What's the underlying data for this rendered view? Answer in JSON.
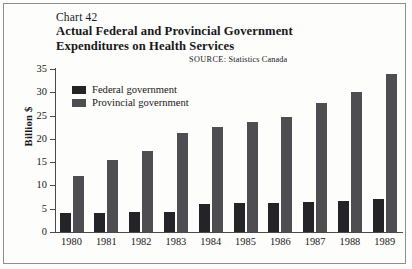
{
  "header": {
    "chart_number": "Chart 42",
    "title_line1": "Actual Federal and Provincial Government",
    "title_line2": "Expenditures on Health Services",
    "source_label": "SOURCE:",
    "source_value": "Statistics Canada"
  },
  "legend": {
    "items": [
      {
        "label": "Federal government",
        "color": "#242428",
        "key": "federal"
      },
      {
        "label": "Provincial government",
        "color": "#4e4e52",
        "key": "provincial"
      }
    ]
  },
  "axes": {
    "ylabel": "Billion $",
    "yticks": [
      "35",
      "30",
      "25",
      "20",
      "15",
      "10",
      "5",
      "0"
    ],
    "ymin": 0,
    "ymax": 35
  },
  "chart_data": {
    "type": "bar",
    "title": "Actual Federal and Provincial Government Expenditures on Health Services",
    "subtitle": "Chart 42",
    "xlabel": "",
    "ylabel": "Billion $",
    "ylim": [
      0,
      35
    ],
    "ytick_step": 5,
    "grid": false,
    "legend_position": "top-left inside plot",
    "categories": [
      "1980",
      "1981",
      "1982",
      "1983",
      "1984",
      "1985",
      "1986",
      "1987",
      "1988",
      "1989"
    ],
    "series": [
      {
        "name": "Federal government",
        "color": "#242428",
        "values": [
          4.0,
          4.0,
          4.3,
          4.2,
          6.0,
          6.2,
          6.2,
          6.5,
          6.7,
          7.0
        ]
      },
      {
        "name": "Provincial government",
        "color": "#4e4e52",
        "values": [
          12.0,
          15.5,
          17.5,
          21.3,
          22.5,
          23.7,
          24.8,
          27.8,
          30.0,
          34.0
        ]
      }
    ],
    "source": "SOURCE: Statistics Canada"
  }
}
